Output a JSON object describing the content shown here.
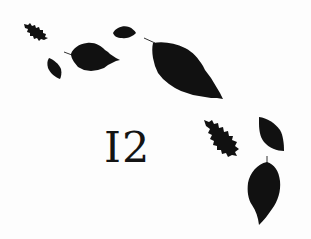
{
  "page": {
    "chapter_number": "I2",
    "ink_color": "#111111",
    "background_color": "#fdfdfd"
  },
  "decorations": {
    "leaves": [
      {
        "id": "leaf-1",
        "type": "oak-leaf"
      },
      {
        "id": "leaf-2",
        "type": "small-oval-leaf"
      },
      {
        "id": "leaf-3",
        "type": "small-oval-leaf"
      },
      {
        "id": "leaf-4",
        "type": "serrated-leaf"
      },
      {
        "id": "leaf-5",
        "type": "large-serrated-leaf"
      },
      {
        "id": "leaf-6",
        "type": "oak-leaf"
      },
      {
        "id": "leaf-7",
        "type": "oval-leaf"
      },
      {
        "id": "leaf-8",
        "type": "large-oval-leaf"
      }
    ]
  }
}
